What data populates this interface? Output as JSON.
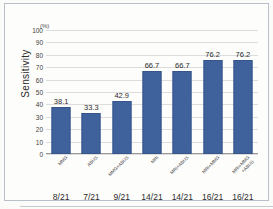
{
  "figure": {
    "unit_label": "(%)",
    "y_axis_title": "Sensitivity"
  },
  "chart_data": {
    "type": "bar",
    "title": "",
    "xlabel": "",
    "ylabel": "Sensitivity",
    "unit": "(%)",
    "ylim": [
      0,
      100
    ],
    "yticks": [
      0,
      10,
      20,
      30,
      40,
      50,
      60,
      70,
      80,
      90,
      100
    ],
    "ytick_labels": [
      "0",
      "10",
      "20",
      "30",
      "40",
      "50",
      "60",
      "70",
      "80",
      "90",
      "100"
    ],
    "grid": true,
    "legend": "none",
    "bar_color": "#40629C",
    "categories": [
      "MMG",
      "ABUS",
      "MMG+ABUS",
      "MRI",
      "MRI+ABUS",
      "MRI+MMG",
      "MRI+MMG\n+ABUS"
    ],
    "values": [
      38.1,
      33.3,
      42.9,
      66.7,
      66.7,
      76.2,
      76.2
    ],
    "value_labels": [
      "38.1",
      "33.3",
      "42.9",
      "66.7",
      "66.7",
      "76.2",
      "76.2"
    ],
    "fractions": [
      "8/21",
      "7/21",
      "9/21",
      "14/21",
      "14/21",
      "16/21",
      "16/21"
    ]
  }
}
